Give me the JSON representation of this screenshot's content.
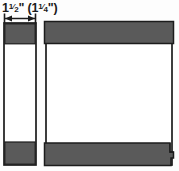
{
  "figure": {
    "title_label": "1½\" (1¼\")",
    "dimension": {
      "primary_whole": "1",
      "primary_fraction_num": "1",
      "primary_fraction_den": "2",
      "primary_unit": "\"",
      "paren_open": "(",
      "alt_whole": "1",
      "alt_fraction_num": "1",
      "alt_fraction_den": "4",
      "alt_unit": "\"",
      "paren_close": ")"
    },
    "colors": {
      "shading": "#5a5a5a",
      "outline": "#1c1c1c",
      "background": "#fdfdfd",
      "white_fill": "#ffffff"
    },
    "parts": {
      "edge_view_name": "edge-view-profile",
      "face_view_name": "face-view-panel",
      "top_band_name": "top-shaded-band",
      "bottom_band_name": "bottom-shaded-band"
    }
  }
}
